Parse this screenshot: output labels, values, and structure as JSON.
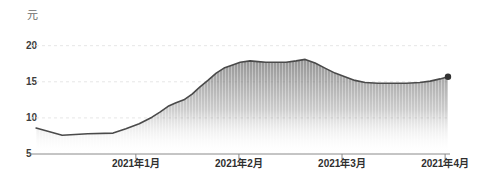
{
  "chart_data": {
    "type": "area",
    "title": "",
    "unit_label": "元",
    "legend": "none",
    "grid": "faint dashed horizontal lines at 10, 15, 20",
    "colors": {
      "line": "#4a4a4a",
      "end_dot": "#333333",
      "fill_top": "#7d7d7d",
      "fill_bottom": "#ffffff",
      "axis": "#8a8a8a",
      "gridline": "#e6e6e6"
    },
    "y_axis": {
      "min": 5,
      "max": 20,
      "ticks": [
        5,
        10,
        15,
        20
      ]
    },
    "x_axis": {
      "ticks": [
        {
          "label": "2021年1月",
          "pos": 0.246
        },
        {
          "label": "2021年2月",
          "pos": 0.495
        },
        {
          "label": "2021年3月",
          "pos": 0.744
        },
        {
          "label": "2021年4月",
          "pos": 0.993
        }
      ]
    },
    "series": [
      {
        "name": "price",
        "end_marker": true,
        "end_value": 15.7,
        "peak_value": 18.1,
        "start_value": 8.6,
        "points": [
          [
            0.005,
            8.6
          ],
          [
            0.068,
            7.6
          ],
          [
            0.13,
            7.8
          ],
          [
            0.191,
            7.9
          ],
          [
            0.222,
            8.5
          ],
          [
            0.254,
            9.2
          ],
          [
            0.285,
            10.1
          ],
          [
            0.304,
            10.8
          ],
          [
            0.324,
            11.6
          ],
          [
            0.343,
            12.1
          ],
          [
            0.362,
            12.5
          ],
          [
            0.382,
            13.3
          ],
          [
            0.401,
            14.3
          ],
          [
            0.42,
            15.2
          ],
          [
            0.44,
            16.2
          ],
          [
            0.459,
            16.9
          ],
          [
            0.478,
            17.3
          ],
          [
            0.498,
            17.7
          ],
          [
            0.522,
            17.9
          ],
          [
            0.541,
            17.8
          ],
          [
            0.56,
            17.7
          ],
          [
            0.585,
            17.7
          ],
          [
            0.609,
            17.7
          ],
          [
            0.633,
            17.9
          ],
          [
            0.655,
            18.1
          ],
          [
            0.679,
            17.6
          ],
          [
            0.703,
            16.9
          ],
          [
            0.727,
            16.2
          ],
          [
            0.751,
            15.7
          ],
          [
            0.775,
            15.2
          ],
          [
            0.8,
            14.9
          ],
          [
            0.831,
            14.8
          ],
          [
            0.865,
            14.8
          ],
          [
            0.899,
            14.8
          ],
          [
            0.932,
            14.9
          ],
          [
            0.957,
            15.1
          ],
          [
            0.981,
            15.4
          ],
          [
            1.0,
            15.7
          ]
        ]
      }
    ]
  }
}
